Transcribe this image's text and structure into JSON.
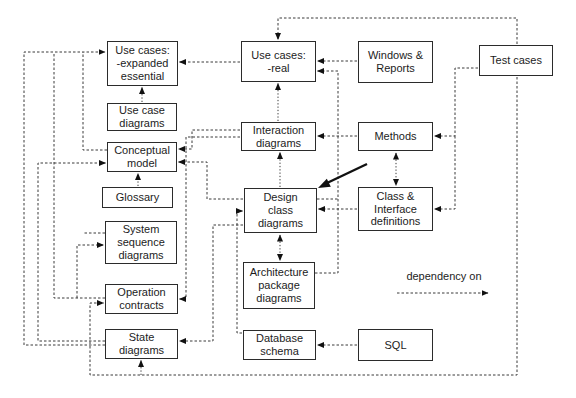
{
  "diagram": {
    "boxes": [
      {
        "id": "use-cases-expanded",
        "label": "Use cases:\n-expanded\nessential"
      },
      {
        "id": "use-case-diagrams",
        "label": "Use case\ndiagrams"
      },
      {
        "id": "conceptual-model",
        "label": "Conceptual\nmodel"
      },
      {
        "id": "glossary",
        "label": "Glossary"
      },
      {
        "id": "system-sequence-diagrams",
        "label": "System\nsequence\ndiagrams"
      },
      {
        "id": "operation-contracts",
        "label": "Operation\ncontracts"
      },
      {
        "id": "state-diagrams",
        "label": "State\ndiagrams"
      },
      {
        "id": "use-cases-real",
        "label": "Use cases:\n-real"
      },
      {
        "id": "interaction-diagrams",
        "label": "Interaction\ndiagrams"
      },
      {
        "id": "design-class-diagrams",
        "label": "Design\nclass\ndiagrams"
      },
      {
        "id": "architecture-package-diagrams",
        "label": "Architecture\npackage\ndiagrams"
      },
      {
        "id": "database-schema",
        "label": "Database\nschema"
      },
      {
        "id": "windows-reports",
        "label": "Windows &\nReports"
      },
      {
        "id": "methods",
        "label": "Methods"
      },
      {
        "id": "class-interface-definitions",
        "label": "Class &\nInterface\ndefinitions"
      },
      {
        "id": "sql",
        "label": "SQL"
      },
      {
        "id": "test-cases",
        "label": "Test cases"
      }
    ],
    "legend": {
      "label": "dependency on"
    },
    "colors": {
      "background": "#ffffff",
      "box_border": "#2b2b2b",
      "line": "#3a3a3a",
      "highlight_arrow": "#111111"
    }
  }
}
